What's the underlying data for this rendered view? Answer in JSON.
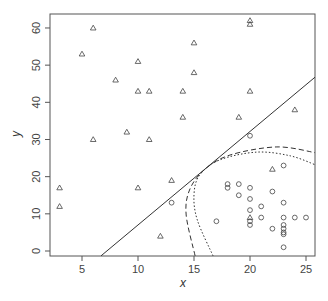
{
  "chart_data": {
    "type": "scatter",
    "title": "",
    "xlabel": "x",
    "ylabel": "y",
    "xlim": [
      2.2,
      25.9
    ],
    "ylim": [
      -1.3,
      63.8
    ],
    "grid": false,
    "legend": null,
    "x_ticks": [
      5,
      10,
      15,
      20,
      25
    ],
    "y_ticks": [
      0,
      10,
      20,
      30,
      40,
      50,
      60
    ],
    "series": [
      {
        "name": "class-triangle",
        "marker": "triangle",
        "points": [
          [
            6,
            60
          ],
          [
            5,
            53
          ],
          [
            10,
            51
          ],
          [
            8,
            46
          ],
          [
            10,
            43
          ],
          [
            11,
            43
          ],
          [
            14,
            43
          ],
          [
            14,
            36
          ],
          [
            9,
            32
          ],
          [
            6,
            30
          ],
          [
            11,
            30
          ],
          [
            3,
            17
          ],
          [
            3,
            12
          ],
          [
            10,
            17
          ],
          [
            13,
            19
          ],
          [
            12,
            4
          ],
          [
            20,
            62
          ],
          [
            20,
            61
          ],
          [
            15,
            56
          ],
          [
            15,
            48
          ],
          [
            20,
            43
          ],
          [
            19,
            36
          ],
          [
            24,
            38
          ],
          [
            22,
            22
          ],
          [
            20,
            9
          ]
        ]
      },
      {
        "name": "class-circle",
        "marker": "circle",
        "points": [
          [
            13,
            13
          ],
          [
            20,
            31
          ],
          [
            23,
            23
          ],
          [
            18,
            18
          ],
          [
            18,
            17
          ],
          [
            19,
            18
          ],
          [
            19,
            15
          ],
          [
            20,
            17
          ],
          [
            20,
            14
          ],
          [
            20,
            11
          ],
          [
            17,
            8
          ],
          [
            20,
            8
          ],
          [
            20,
            7
          ],
          [
            22,
            16
          ],
          [
            21,
            12
          ],
          [
            23,
            13
          ],
          [
            21,
            9
          ],
          [
            23,
            9
          ],
          [
            24,
            9
          ],
          [
            25,
            9
          ],
          [
            22,
            6
          ],
          [
            23,
            7
          ],
          [
            23,
            6
          ],
          [
            23,
            5
          ],
          [
            23,
            4.5
          ],
          [
            23,
            1
          ]
        ]
      }
    ],
    "curves": [
      {
        "name": "linear-boundary",
        "style": "solid",
        "points": [
          [
            6.7,
            -1.3
          ],
          [
            25.9,
            47
          ]
        ]
      },
      {
        "name": "dashed-boundary",
        "style": "dashed",
        "points": [
          [
            15.1,
            -1.3
          ],
          [
            14.3,
            9.7
          ],
          [
            14.6,
            16.4
          ],
          [
            15.9,
            21.8
          ],
          [
            18.2,
            25.8
          ],
          [
            22.4,
            28
          ],
          [
            25.9,
            26.4
          ]
        ]
      },
      {
        "name": "dotted-boundary",
        "style": "dotted",
        "points": [
          [
            16.7,
            -1.3
          ],
          [
            15.3,
            8.3
          ],
          [
            15.0,
            15.1
          ],
          [
            15.5,
            20.4
          ],
          [
            17.3,
            24.5
          ],
          [
            20.6,
            26.6
          ],
          [
            23.6,
            25.6
          ],
          [
            25.9,
            23.1
          ]
        ]
      }
    ]
  },
  "axes": {
    "x_title": "x",
    "y_title": "y",
    "x_tick_labels": [
      "5",
      "10",
      "15",
      "20",
      "25"
    ],
    "y_tick_labels": [
      "0",
      "10",
      "20",
      "30",
      "40",
      "50",
      "60"
    ]
  },
  "colors": {
    "axis": "#555555",
    "marker": "#444444",
    "line": "#333333"
  }
}
